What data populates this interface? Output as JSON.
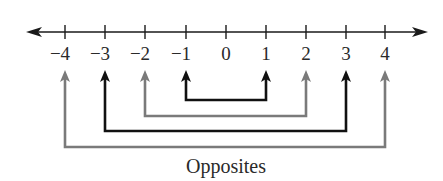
{
  "diagram": {
    "title": "Opposites",
    "number_line": {
      "min": -4,
      "max": 4,
      "ticks": [
        "−4",
        "−3",
        "−2",
        "−1",
        "0",
        "1",
        "2",
        "3",
        "4"
      ],
      "axis_color": "#1a1a1a"
    },
    "pairs": [
      {
        "a": "−1",
        "b": "1",
        "color": "#111111"
      },
      {
        "a": "−2",
        "b": "2",
        "color": "#7a7a7a"
      },
      {
        "a": "−3",
        "b": "3",
        "color": "#111111"
      },
      {
        "a": "−4",
        "b": "4",
        "color": "#7a7a7a"
      }
    ],
    "caption": "Opposites"
  }
}
